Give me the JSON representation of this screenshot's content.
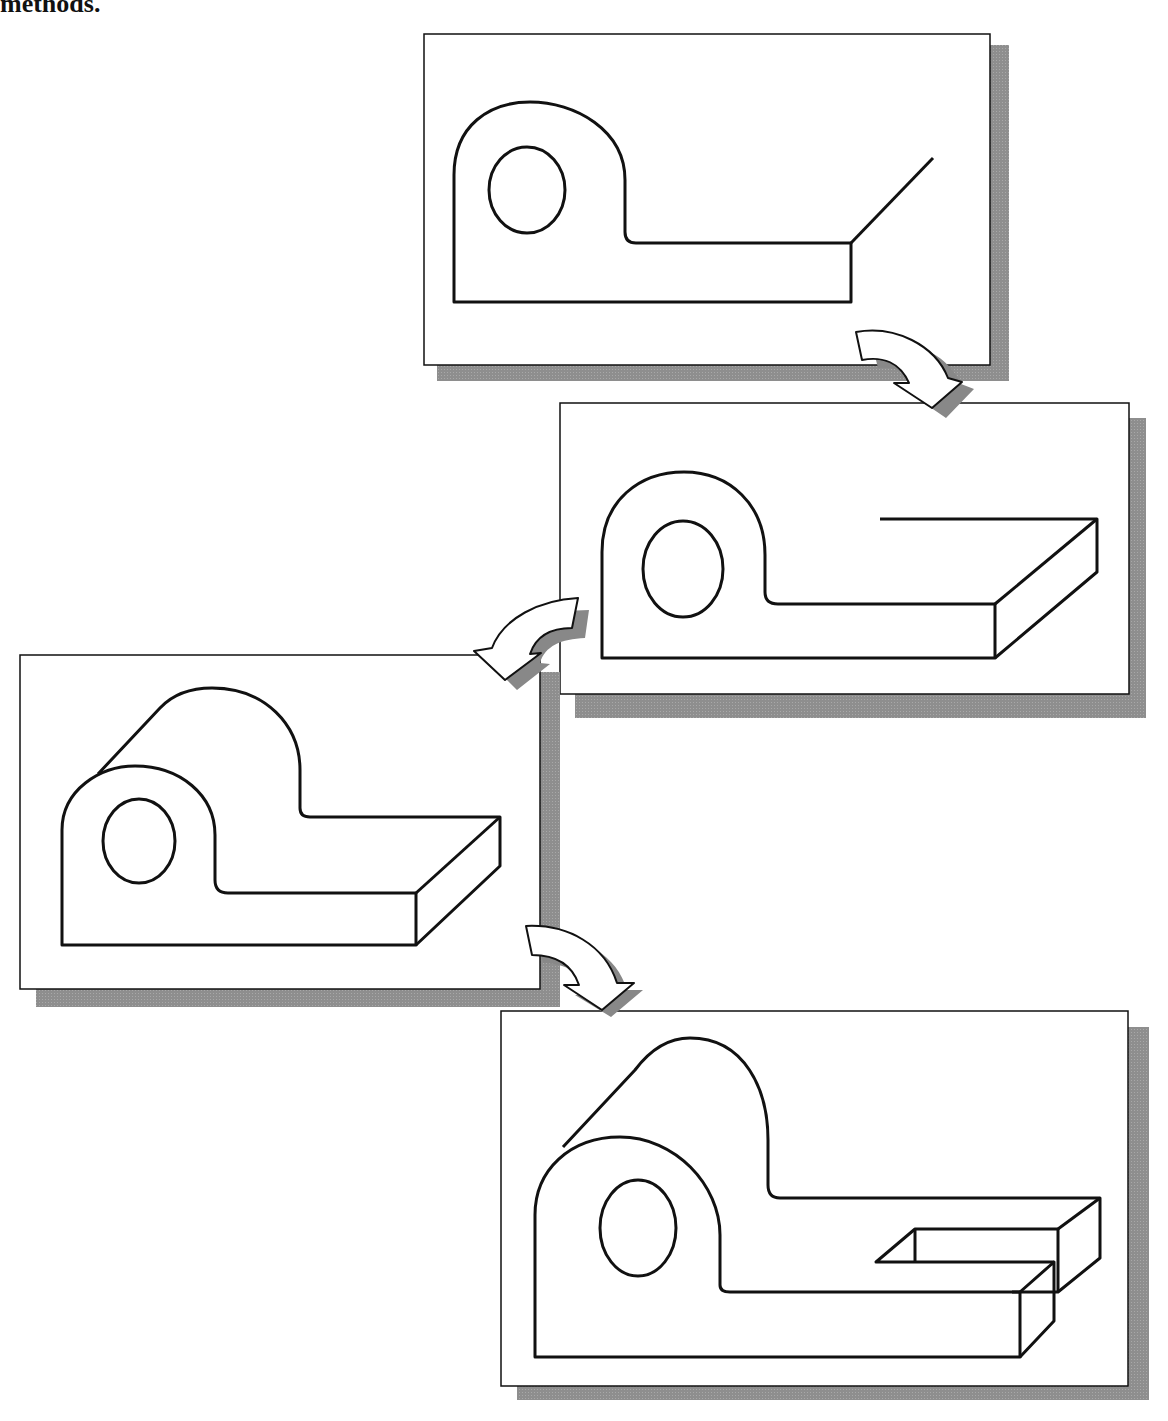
{
  "caption": "methods.",
  "colors": {
    "line": "#111111",
    "shadow": "#8c8c8c",
    "panel": "#ffffff"
  },
  "panels": [
    {
      "id": "step-1",
      "description": "2D profile with start of depth line"
    },
    {
      "id": "step-2",
      "description": "Profile extruded partially along base"
    },
    {
      "id": "step-3",
      "description": "Full extruded block with rounded boss"
    },
    {
      "id": "step-4",
      "description": "Final part with slot cut"
    }
  ],
  "arrows": [
    {
      "from": "step-1",
      "to": "step-2",
      "icon": "curved-arrow-icon"
    },
    {
      "from": "step-2",
      "to": "step-3",
      "icon": "curved-arrow-icon"
    },
    {
      "from": "step-3",
      "to": "step-4",
      "icon": "curved-arrow-icon"
    }
  ]
}
